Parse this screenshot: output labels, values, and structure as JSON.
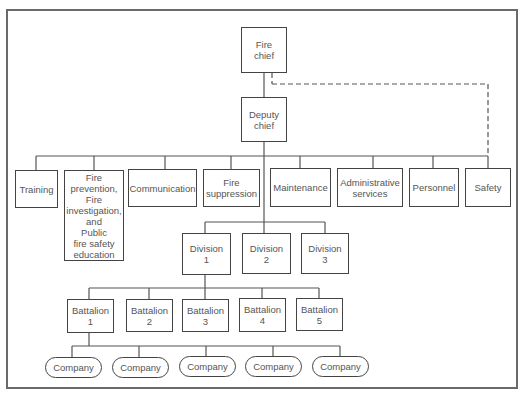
{
  "chart_title": "",
  "nodes": {
    "fire_chief": {
      "label": "Fire\nchief",
      "x": 241,
      "y": 27,
      "w": 46,
      "h": 46
    },
    "deputy_chief": {
      "label": "Deputy\nchief",
      "x": 241,
      "y": 97,
      "w": 46,
      "h": 45
    },
    "departments": [
      {
        "label": "Training",
        "x": 15,
        "y": 170,
        "w": 43,
        "h": 38
      },
      {
        "label": "Fire\nprevention,\nFire\ninvestigation,\nand\nPublic\nfire safety\neducation",
        "x": 64,
        "y": 170,
        "w": 60,
        "h": 91
      },
      {
        "label": "Communication",
        "x": 128,
        "y": 169,
        "w": 69,
        "h": 38
      },
      {
        "label": "Fire\nsuppression",
        "x": 203,
        "y": 169,
        "w": 57,
        "h": 38
      },
      {
        "label": "Maintenance",
        "x": 270,
        "y": 168,
        "w": 61,
        "h": 39
      },
      {
        "label": "Administrative\nservices",
        "x": 337,
        "y": 168,
        "w": 66,
        "h": 39
      },
      {
        "label": "Personnel",
        "x": 409,
        "y": 168,
        "w": 50,
        "h": 39
      },
      {
        "label": "Safety",
        "x": 465,
        "y": 168,
        "w": 46,
        "h": 39
      }
    ],
    "divisions": [
      {
        "label": "Division\n1",
        "x": 182,
        "y": 233,
        "w": 49,
        "h": 42
      },
      {
        "label": "Division\n2",
        "x": 242,
        "y": 233,
        "w": 49,
        "h": 41
      },
      {
        "label": "Division\n3",
        "x": 301,
        "y": 233,
        "w": 48,
        "h": 41
      }
    ],
    "battalions": [
      {
        "label": "Battalion\n1",
        "x": 67,
        "y": 299,
        "w": 47,
        "h": 34
      },
      {
        "label": "Battalion\n2",
        "x": 126,
        "y": 299,
        "w": 47,
        "h": 33
      },
      {
        "label": "Battalion\n3",
        "x": 182,
        "y": 299,
        "w": 47,
        "h": 33
      },
      {
        "label": "Battalion\n4",
        "x": 239,
        "y": 298,
        "w": 47,
        "h": 34
      },
      {
        "label": "Battalion\n5",
        "x": 296,
        "y": 298,
        "w": 47,
        "h": 33
      }
    ],
    "companies": [
      {
        "label": "Company",
        "x": 45,
        "y": 357,
        "w": 57,
        "h": 21
      },
      {
        "label": "Company",
        "x": 112,
        "y": 357,
        "w": 57,
        "h": 21
      },
      {
        "label": "Company",
        "x": 179,
        "y": 356,
        "w": 57,
        "h": 21
      },
      {
        "label": "Company",
        "x": 245,
        "y": 356,
        "w": 57,
        "h": 21
      },
      {
        "label": "Company",
        "x": 312,
        "y": 356,
        "w": 57,
        "h": 21
      }
    ]
  },
  "connectors": {
    "solid": [
      [
        264,
        73,
        264,
        97
      ],
      [
        264,
        142,
        264,
        233
      ],
      [
        36,
        156,
        488,
        156
      ],
      [
        36,
        156,
        36,
        170
      ],
      [
        94,
        156,
        94,
        170
      ],
      [
        165,
        156,
        165,
        169
      ],
      [
        231,
        156,
        231,
        169
      ],
      [
        300,
        156,
        300,
        168
      ],
      [
        373,
        156,
        373,
        168
      ],
      [
        433,
        156,
        433,
        168
      ],
      [
        488,
        156,
        488,
        168
      ],
      [
        205,
        222,
        325,
        222
      ],
      [
        205,
        222,
        205,
        233
      ],
      [
        325,
        222,
        325,
        233
      ],
      [
        205,
        275,
        205,
        299
      ],
      [
        89,
        288,
        319,
        288
      ],
      [
        89,
        288,
        89,
        299
      ],
      [
        149,
        288,
        149,
        299
      ],
      [
        319,
        288,
        319,
        298
      ],
      [
        262,
        288,
        262,
        298
      ],
      [
        89,
        333,
        89,
        346
      ],
      [
        72,
        346,
        340,
        346
      ],
      [
        72,
        346,
        72,
        357
      ],
      [
        139,
        346,
        139,
        357
      ],
      [
        206,
        346,
        206,
        356
      ],
      [
        273,
        346,
        273,
        356
      ],
      [
        340,
        346,
        340,
        356
      ]
    ],
    "dashed": [
      [
        272,
        73,
        272,
        84
      ],
      [
        272,
        84,
        488,
        84
      ],
      [
        488,
        84,
        488,
        156
      ]
    ]
  }
}
